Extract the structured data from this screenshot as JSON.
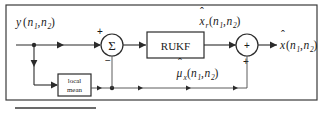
{
  "diagram": {
    "frame": {
      "visible": true
    },
    "input": {
      "name": "input-signal-label",
      "base": "y",
      "open_paren": "(",
      "arg1": "n",
      "arg1_sub": "1",
      "comma": ",",
      "arg2": "n",
      "arg2_sub": "2",
      "close_paren": ")"
    },
    "summing_junction": {
      "name": "summing-junction",
      "symbol": "Σ",
      "plus_sign": "+",
      "minus_sign": "−"
    },
    "filter_block": {
      "name": "rukf-block",
      "label": "RUKF"
    },
    "local_mean_block": {
      "name": "local-mean-block",
      "label_line1": "local",
      "label_line2": "mean"
    },
    "adder": {
      "name": "output-adder",
      "plus_sign": "+",
      "plus_sign_bottom": "+"
    },
    "residual_label": {
      "name": "residual-estimate-label",
      "hat": "ˆ",
      "base": "x",
      "base_sub": "r",
      "open_paren": "(",
      "arg1": "n",
      "arg1_sub": "1",
      "comma": ",",
      "arg2": "n",
      "arg2_sub": "2",
      "close_paren": ")"
    },
    "mean_label": {
      "name": "local-mean-estimate-label",
      "hat": "ˆ",
      "base": "μ",
      "base_sub": "x",
      "open_paren": "(",
      "arg1": "n",
      "arg1_sub": "1",
      "comma": ",",
      "arg2": "n",
      "arg2_sub": "2",
      "close_paren": ")"
    },
    "output_label": {
      "name": "output-estimate-label",
      "hat": "ˆ",
      "base": "x",
      "open_paren": "(",
      "arg1": "n",
      "arg1_sub": "1",
      "comma": ",",
      "arg2": "n",
      "arg2_sub": "2",
      "close_paren": ")"
    },
    "footer_rule": {
      "name": "footer-rule"
    },
    "colors": {
      "ink": "#2b2b2b",
      "frame": "#3a3a3a",
      "paper": "#ffffff",
      "thin_wire": "#4a4a4a"
    }
  }
}
